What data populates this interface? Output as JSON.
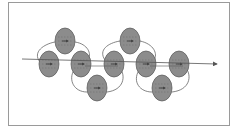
{
  "diagram": {
    "type": "linked-ellipse-chain",
    "colors": {
      "ellipse_fill": "#8c8c8c",
      "ellipse_stroke": "#555555",
      "line": "#555555",
      "frame": "#9a9a9a",
      "inner_dash": "#6a6a6a"
    },
    "main_arrow": {
      "x1": 22,
      "y1": 59,
      "x2": 217,
      "y2": 64
    },
    "nodes": [
      {
        "id": "n1",
        "cx": 65,
        "cy": 41,
        "rx": 10,
        "ry": 13
      },
      {
        "id": "n2",
        "cx": 49,
        "cy": 64,
        "rx": 10,
        "ry": 13
      },
      {
        "id": "n3",
        "cx": 81,
        "cy": 64,
        "rx": 10,
        "ry": 13
      },
      {
        "id": "n4",
        "cx": 97,
        "cy": 88,
        "rx": 10,
        "ry": 13
      },
      {
        "id": "n5",
        "cx": 114,
        "cy": 64,
        "rx": 10,
        "ry": 13
      },
      {
        "id": "n6",
        "cx": 130,
        "cy": 41,
        "rx": 10,
        "ry": 13
      },
      {
        "id": "n7",
        "cx": 146,
        "cy": 64,
        "rx": 10,
        "ry": 13
      },
      {
        "id": "n8",
        "cx": 162,
        "cy": 88,
        "rx": 10,
        "ry": 13
      },
      {
        "id": "n9",
        "cx": 179,
        "cy": 64,
        "rx": 10,
        "ry": 13
      }
    ],
    "loops": [
      {
        "id": "loop1",
        "from": "n2",
        "to": "n3",
        "via": "n1"
      },
      {
        "id": "loop2",
        "from": "n3",
        "to": "n5",
        "via": "n4"
      },
      {
        "id": "loop3",
        "from": "n5",
        "to": "n7",
        "via": "n6"
      },
      {
        "id": "loop4",
        "from": "n7",
        "to": "n9",
        "via": "n8"
      }
    ]
  }
}
